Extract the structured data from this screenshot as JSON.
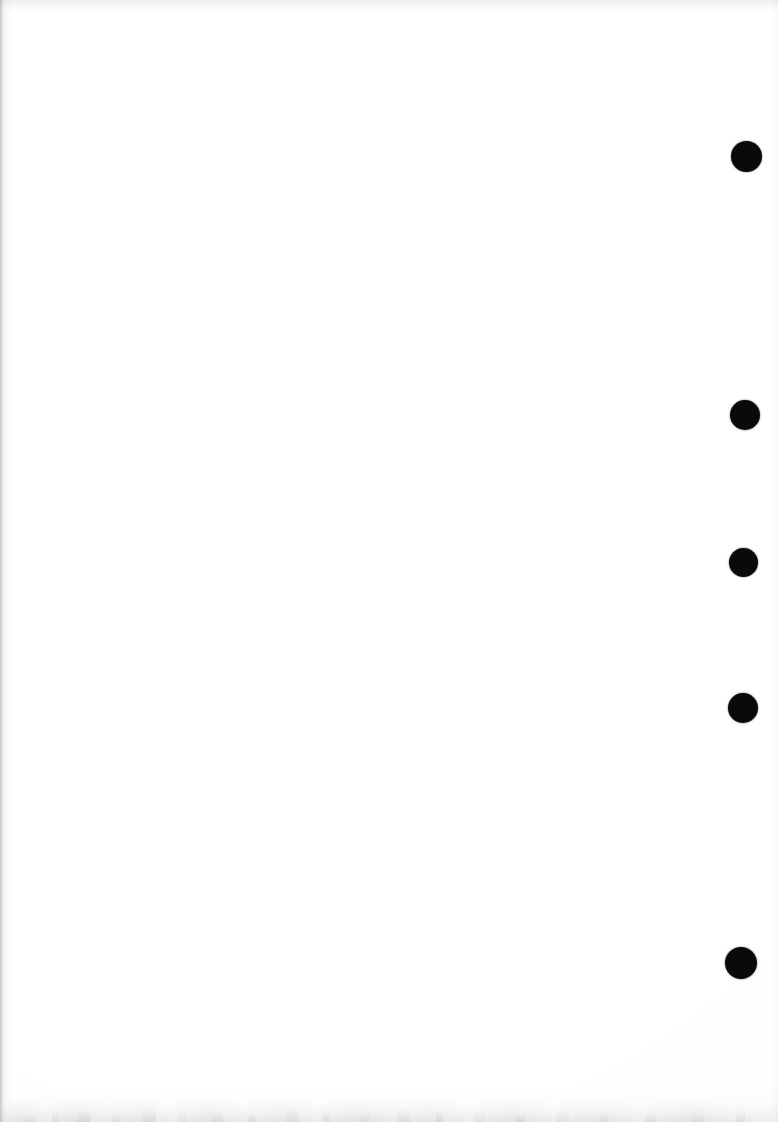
{
  "page": {
    "width": 778,
    "height": 1122,
    "background_color": "#ffffff",
    "content_text": "",
    "note": "blank white sheet, no text or figures"
  },
  "marks": {
    "label": "binder punch marks",
    "color": "#0a0a0a",
    "count": 5,
    "items": [
      {
        "name": "punch-mark-1",
        "cx": 746,
        "cy": 156,
        "d": 31
      },
      {
        "name": "punch-mark-2",
        "cx": 745,
        "cy": 415,
        "d": 30
      },
      {
        "name": "punch-mark-3",
        "cx": 743,
        "cy": 562,
        "d": 29
      },
      {
        "name": "punch-mark-4",
        "cx": 743,
        "cy": 708,
        "d": 30
      },
      {
        "name": "punch-mark-5",
        "cx": 741,
        "cy": 963,
        "d": 32
      }
    ]
  },
  "artifacts": {
    "label": "scanner edge shadows",
    "shadow_color": "#aaaaae",
    "edges": [
      "left",
      "top",
      "right",
      "bottom"
    ],
    "bottom_smudge": "mottled gray band along bottom edge",
    "speckles": [
      {
        "x": 26,
        "w": 10
      },
      {
        "x": 52,
        "w": 7
      },
      {
        "x": 78,
        "w": 12
      },
      {
        "x": 112,
        "w": 8
      },
      {
        "x": 142,
        "w": 14
      },
      {
        "x": 178,
        "w": 9
      },
      {
        "x": 212,
        "w": 11
      },
      {
        "x": 248,
        "w": 7
      },
      {
        "x": 286,
        "w": 13
      },
      {
        "x": 322,
        "w": 8
      },
      {
        "x": 360,
        "w": 10
      },
      {
        "x": 398,
        "w": 12
      },
      {
        "x": 436,
        "w": 7
      },
      {
        "x": 474,
        "w": 11
      },
      {
        "x": 516,
        "w": 9
      },
      {
        "x": 556,
        "w": 13
      },
      {
        "x": 600,
        "w": 8
      },
      {
        "x": 646,
        "w": 10
      },
      {
        "x": 692,
        "w": 12
      },
      {
        "x": 736,
        "w": 9
      }
    ]
  }
}
